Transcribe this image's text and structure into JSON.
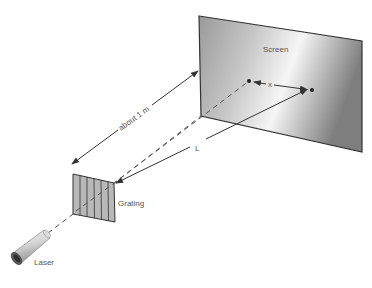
{
  "diagram": {
    "labels": {
      "screen": "Screen",
      "x": "x",
      "about": "about 1 m",
      "L": "L",
      "grating": "Grating",
      "laser": "Laser"
    },
    "colors": {
      "line": "#333333",
      "screen_dark": "#8a8a8a",
      "screen_light": "#f4f4f4",
      "grating_fill": "#b5b5b5",
      "label": "#555555"
    },
    "components": [
      "Laser",
      "Grating",
      "Screen"
    ],
    "measurements": [
      {
        "name": "x",
        "description": "separation between spots on screen"
      },
      {
        "name": "L",
        "description": "grating to screen spot distance"
      },
      {
        "name": "about 1 m",
        "description": "grating to screen distance"
      }
    ]
  }
}
